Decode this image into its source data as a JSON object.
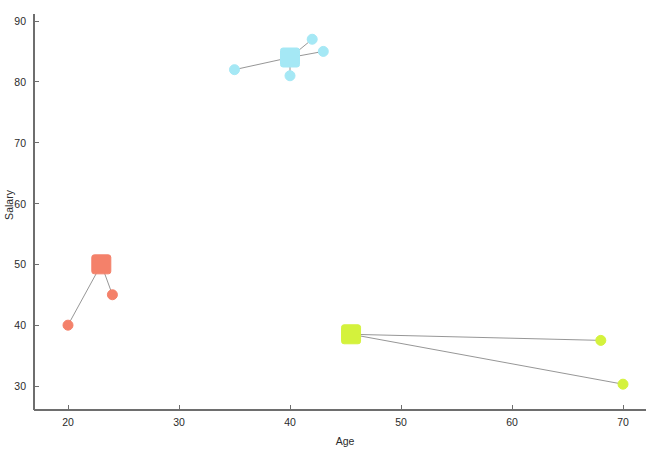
{
  "chart_data": {
    "type": "scatter",
    "title": "",
    "xlabel": "Age",
    "ylabel": "Salary",
    "xlim": [
      17.5,
      71.5
    ],
    "ylim": [
      26.5,
      91.5
    ],
    "xticks": [
      20,
      30,
      40,
      50,
      60,
      70
    ],
    "yticks": [
      30,
      40,
      50,
      60,
      70,
      80,
      90
    ],
    "xtick_labels": [
      "20",
      "30",
      "40",
      "50",
      "60",
      "70"
    ],
    "ytick_labels": [
      "30",
      "40",
      "50",
      "60",
      "70",
      "80",
      "90"
    ],
    "grid": false,
    "legend": "none",
    "background": "#ffffff",
    "axis_color": "#6e6e6e",
    "link_color": "#8a8a8a",
    "series": [
      {
        "name": "cluster-red",
        "color": "#F4816A",
        "centroid": {
          "x": 23,
          "y": 50
        },
        "points": [
          {
            "x": 20,
            "y": 40
          },
          {
            "x": 24,
            "y": 45
          }
        ]
      },
      {
        "name": "cluster-cyan",
        "color": "#A5E8F5",
        "centroid": {
          "x": 40,
          "y": 84
        },
        "points": [
          {
            "x": 35,
            "y": 82
          },
          {
            "x": 40,
            "y": 81
          },
          {
            "x": 42,
            "y": 87
          },
          {
            "x": 43,
            "y": 85
          }
        ]
      },
      {
        "name": "cluster-green",
        "color": "#D4F23C",
        "centroid": {
          "x": 45.5,
          "y": 38.5
        },
        "points": [
          {
            "x": 68,
            "y": 37.5
          },
          {
            "x": 70,
            "y": 30.3
          }
        ]
      }
    ]
  }
}
